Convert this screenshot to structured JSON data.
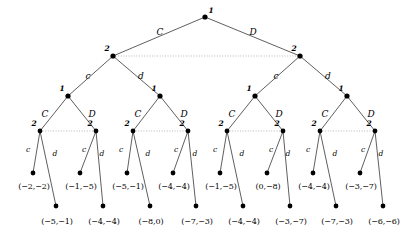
{
  "figure": {
    "type": "extensive-form-game-tree",
    "background_color": "#ffffff",
    "line_color": "#1a1a1a",
    "info_set_color": "#9a9a9a",
    "node_color": "#000000"
  },
  "nodes": {
    "root": {
      "player": "1",
      "x": 205,
      "y": 17
    },
    "level1": [
      {
        "player": "2",
        "x": 113,
        "y": 56
      },
      {
        "player": "2",
        "x": 300,
        "y": 56
      }
    ],
    "level2": [
      {
        "player": "1",
        "x": 68,
        "y": 96
      },
      {
        "player": "1",
        "x": 160,
        "y": 96
      },
      {
        "player": "1",
        "x": 255,
        "y": 96
      },
      {
        "player": "1",
        "x": 347,
        "y": 96
      }
    ],
    "level3": [
      {
        "player": "2",
        "x": 40,
        "y": 131
      },
      {
        "player": "2",
        "x": 96,
        "y": 131
      },
      {
        "player": "2",
        "x": 133,
        "y": 131
      },
      {
        "player": "2",
        "x": 188,
        "y": 131
      },
      {
        "player": "2",
        "x": 227,
        "y": 131
      },
      {
        "player": "2",
        "x": 283,
        "y": 131
      },
      {
        "player": "2",
        "x": 320,
        "y": 131
      },
      {
        "player": "2",
        "x": 375,
        "y": 131
      }
    ],
    "terminals_upper": [
      {
        "x": 33,
        "y": 173
      },
      {
        "x": 80,
        "y": 173
      },
      {
        "x": 127,
        "y": 173
      },
      {
        "x": 173,
        "y": 173
      },
      {
        "x": 220,
        "y": 173
      },
      {
        "x": 267,
        "y": 173
      },
      {
        "x": 313,
        "y": 173
      },
      {
        "x": 360,
        "y": 173
      }
    ],
    "terminals_lower": [
      {
        "x": 56,
        "y": 206
      },
      {
        "x": 103,
        "y": 206
      },
      {
        "x": 150,
        "y": 206
      },
      {
        "x": 196,
        "y": 206
      },
      {
        "x": 243,
        "y": 206
      },
      {
        "x": 290,
        "y": 206
      },
      {
        "x": 336,
        "y": 206
      },
      {
        "x": 383,
        "y": 206
      }
    ]
  },
  "player_labels": {
    "root": "1",
    "level1": [
      "2",
      "2"
    ],
    "level2": [
      "1",
      "1",
      "1",
      "1"
    ],
    "level3": [
      "2",
      "2",
      "2",
      "2",
      "2",
      "2",
      "2",
      "2"
    ]
  },
  "actions": {
    "root_left": "C",
    "root_right": "D",
    "level1_left": "c",
    "level1_right": "d",
    "level2_left": "C",
    "level2_right": "D",
    "level3_left": "c",
    "level3_right": "d"
  },
  "edge_labels": {
    "root": [
      {
        "text": "C",
        "x": 160,
        "y": 32,
        "size": "large"
      },
      {
        "text": "D",
        "x": 253,
        "y": 32,
        "size": "large"
      }
    ],
    "level1": [
      {
        "text": "c",
        "x": 88,
        "y": 76,
        "size": "large"
      },
      {
        "text": "d",
        "x": 141,
        "y": 76,
        "size": "large"
      },
      {
        "text": "c",
        "x": 276,
        "y": 76,
        "size": "large"
      },
      {
        "text": "d",
        "x": 328,
        "y": 76,
        "size": "large"
      }
    ],
    "level2": [
      {
        "text": "C",
        "x": 45,
        "y": 114,
        "size": "large"
      },
      {
        "text": "D",
        "x": 92,
        "y": 114,
        "size": "large"
      },
      {
        "text": "C",
        "x": 138,
        "y": 114,
        "size": "large"
      },
      {
        "text": "D",
        "x": 184,
        "y": 114,
        "size": "large"
      },
      {
        "text": "C",
        "x": 232,
        "y": 114,
        "size": "large"
      },
      {
        "text": "D",
        "x": 279,
        "y": 114,
        "size": "large"
      },
      {
        "text": "C",
        "x": 325,
        "y": 114,
        "size": "large"
      },
      {
        "text": "D",
        "x": 371,
        "y": 114,
        "size": "large"
      }
    ],
    "level3": [
      {
        "text": "c",
        "x": 28,
        "y": 150,
        "size": "small"
      },
      {
        "text": "d",
        "x": 55,
        "y": 154,
        "size": "small"
      },
      {
        "text": "c",
        "x": 84,
        "y": 150,
        "size": "small"
      },
      {
        "text": "d",
        "x": 102,
        "y": 154,
        "size": "small"
      },
      {
        "text": "c",
        "x": 121,
        "y": 150,
        "size": "small"
      },
      {
        "text": "d",
        "x": 148,
        "y": 154,
        "size": "small"
      },
      {
        "text": "c",
        "x": 176,
        "y": 150,
        "size": "small"
      },
      {
        "text": "d",
        "x": 195,
        "y": 154,
        "size": "small"
      },
      {
        "text": "c",
        "x": 215,
        "y": 150,
        "size": "small"
      },
      {
        "text": "d",
        "x": 242,
        "y": 154,
        "size": "small"
      },
      {
        "text": "c",
        "x": 271,
        "y": 150,
        "size": "small"
      },
      {
        "text": "d",
        "x": 288,
        "y": 154,
        "size": "small"
      },
      {
        "text": "c",
        "x": 308,
        "y": 150,
        "size": "small"
      },
      {
        "text": "d",
        "x": 335,
        "y": 154,
        "size": "small"
      },
      {
        "text": "c",
        "x": 363,
        "y": 150,
        "size": "small"
      },
      {
        "text": "d",
        "x": 381,
        "y": 154,
        "size": "small"
      }
    ]
  },
  "payoffs_upper": [
    {
      "text": "(−2,−2)",
      "x": 34,
      "y": 187
    },
    {
      "text": "(−1,−5)",
      "x": 81,
      "y": 187
    },
    {
      "text": "(−5,−1)",
      "x": 128,
      "y": 187
    },
    {
      "text": "(−4,−4)",
      "x": 174,
      "y": 187
    },
    {
      "text": "(−1,−5)",
      "x": 221,
      "y": 187
    },
    {
      "text": "(0,−8)",
      "x": 268,
      "y": 187
    },
    {
      "text": "(−4,−4)",
      "x": 314,
      "y": 187
    },
    {
      "text": "(−3,−7)",
      "x": 361,
      "y": 187
    }
  ],
  "payoffs_lower": [
    {
      "text": "(−5,−1)",
      "x": 57,
      "y": 222
    },
    {
      "text": "(−4,−4)",
      "x": 104,
      "y": 222
    },
    {
      "text": "(−8,0)",
      "x": 151,
      "y": 222
    },
    {
      "text": "(−7,−3)",
      "x": 197,
      "y": 222
    },
    {
      "text": "(−4,−4)",
      "x": 244,
      "y": 222
    },
    {
      "text": "(−3,−7)",
      "x": 291,
      "y": 222
    },
    {
      "text": "(−7,−3)",
      "x": 337,
      "y": 222
    },
    {
      "text": "(−6,−6)",
      "x": 384,
      "y": 222
    }
  ],
  "info_sets": [
    {
      "name": "level1-info-set",
      "x1": 113,
      "y1": 56,
      "x2": 300,
      "y2": 56
    },
    {
      "name": "level3-info-set-1",
      "x1": 40,
      "y1": 131,
      "x2": 96,
      "y2": 131
    },
    {
      "name": "level3-info-set-2",
      "x1": 133,
      "y1": 131,
      "x2": 188,
      "y2": 131
    },
    {
      "name": "level3-info-set-3",
      "x1": 227,
      "y1": 131,
      "x2": 283,
      "y2": 131
    },
    {
      "name": "level3-info-set-4",
      "x1": 320,
      "y1": 131,
      "x2": 375,
      "y2": 131
    }
  ]
}
